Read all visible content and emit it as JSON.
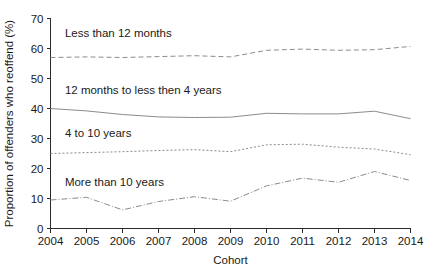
{
  "chart_data": {
    "type": "line",
    "title": "",
    "subtitle": "",
    "xlabel": "Cohort",
    "ylabel": "Proportion of offenders who reoffend (%)",
    "x": [
      2004,
      2005,
      2006,
      2007,
      2008,
      2009,
      2010,
      2011,
      2012,
      2013,
      2014
    ],
    "categories": [
      "2004",
      "2005",
      "2006",
      "2007",
      "2008",
      "2009",
      "2010",
      "2011",
      "2012",
      "2013",
      "2014"
    ],
    "xlim": [
      2004,
      2014
    ],
    "ylim": [
      0,
      70
    ],
    "yticks": [
      0,
      10,
      20,
      30,
      40,
      50,
      60,
      70
    ],
    "ytick_labels": [
      "0",
      "10",
      "20",
      "30",
      "40",
      "50",
      "60",
      "70"
    ],
    "xticks": [
      2004,
      2005,
      2006,
      2007,
      2008,
      2009,
      2010,
      2011,
      2012,
      2013,
      2014
    ],
    "xtick_labels": [
      "2004",
      "2005",
      "2006",
      "2007",
      "2008",
      "2009",
      "2010",
      "2011",
      "2012",
      "2013",
      "2014"
    ],
    "grid": false,
    "legend_position": "inline-labels",
    "series": [
      {
        "name": "Less than 12 months",
        "label": "Less than 12 months",
        "values": [
          57.0,
          57.2,
          57.0,
          57.3,
          57.6,
          57.2,
          59.4,
          59.8,
          59.4,
          59.6,
          60.7
        ],
        "color": "#8c8c8c",
        "dash": "5,3",
        "label_x": 2004.4,
        "label_y": 64.0
      },
      {
        "name": "12 months to less then 4 years",
        "label": "12 months to less then 4 years",
        "values": [
          40.0,
          39.2,
          38.0,
          37.2,
          37.0,
          37.1,
          38.4,
          38.2,
          38.2,
          39.1,
          36.6
        ],
        "color": "#8c8c8c",
        "dash": "none",
        "label_x": 2004.4,
        "label_y": 45.0
      },
      {
        "name": "4 to 10 years",
        "label": "4 to 10 years",
        "values": [
          25.0,
          25.3,
          25.6,
          26.0,
          26.3,
          25.6,
          27.9,
          28.1,
          27.1,
          26.5,
          24.6
        ],
        "color": "#8c8c8c",
        "dash": "2,2",
        "label_x": 2004.4,
        "label_y": 30.4
      },
      {
        "name": "More than 10 years",
        "label": "More than 10 years",
        "values": [
          9.5,
          10.4,
          6.2,
          9.0,
          10.6,
          9.1,
          14.2,
          16.8,
          15.4,
          19.0,
          16.0
        ],
        "color": "#8c8c8c",
        "dash": "6,2,1,2",
        "label_x": 2004.4,
        "label_y": 14.3
      }
    ]
  }
}
